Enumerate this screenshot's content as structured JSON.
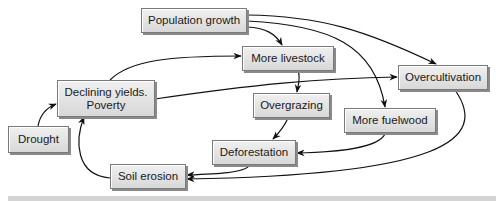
{
  "diagram": {
    "nodes": [
      {
        "id": "population-growth",
        "label": "Population growth",
        "x": 141,
        "y": 8,
        "w": 106,
        "h": 25
      },
      {
        "id": "more-livestock",
        "label": "More livestock",
        "x": 242,
        "y": 46,
        "w": 92,
        "h": 25
      },
      {
        "id": "overcultivation",
        "label": "Overcultivation",
        "x": 398,
        "y": 65,
        "w": 90,
        "h": 25
      },
      {
        "id": "declining-yields-poverty",
        "label": "Declining yields.",
        "label2": "Poverty",
        "x": 57,
        "y": 80,
        "w": 98,
        "h": 37
      },
      {
        "id": "overgrazing",
        "label": "Overgrazing",
        "x": 253,
        "y": 93,
        "w": 77,
        "h": 25
      },
      {
        "id": "more-fuelwood",
        "label": "More fuelwood",
        "x": 344,
        "y": 108,
        "w": 92,
        "h": 25
      },
      {
        "id": "drought",
        "label": "Drought",
        "x": 8,
        "y": 126,
        "w": 61,
        "h": 27
      },
      {
        "id": "deforestation",
        "label": "Deforestation",
        "x": 212,
        "y": 140,
        "w": 84,
        "h": 25
      },
      {
        "id": "soil-erosion",
        "label": "Soil erosion",
        "x": 110,
        "y": 164,
        "w": 76,
        "h": 25
      }
    ],
    "edges": [
      {
        "from": "population-growth",
        "to": "more-livestock"
      },
      {
        "from": "population-growth",
        "to": "overcultivation"
      },
      {
        "from": "population-growth",
        "to": "more-fuelwood"
      },
      {
        "from": "declining-yields-poverty",
        "to": "more-livestock"
      },
      {
        "from": "declining-yields-poverty",
        "to": "overcultivation"
      },
      {
        "from": "more-livestock",
        "to": "overgrazing"
      },
      {
        "from": "overgrazing",
        "to": "deforestation"
      },
      {
        "from": "more-fuelwood",
        "to": "deforestation"
      },
      {
        "from": "deforestation",
        "to": "soil-erosion"
      },
      {
        "from": "overcultivation",
        "to": "soil-erosion"
      },
      {
        "from": "soil-erosion",
        "to": "declining-yields-poverty"
      },
      {
        "from": "drought",
        "to": "declining-yields-poverty"
      }
    ],
    "colors": {
      "box_fill": "#e4e4e4",
      "box_border": "#7a7a7a",
      "arrow": "#111111",
      "band": "#d4d4d4"
    }
  }
}
